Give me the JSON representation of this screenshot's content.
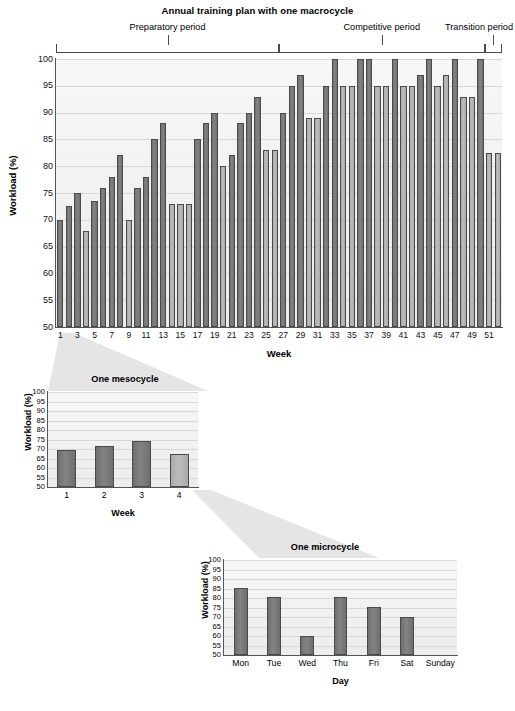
{
  "main": {
    "title": "Annual training plan with one macrocycle",
    "ylabel": "Workload (%)",
    "xlabel": "Week",
    "periods": [
      {
        "label": "Preparatory period"
      },
      {
        "label": "Competitive period"
      },
      {
        "label": "Transition period"
      }
    ]
  },
  "meso": {
    "title": "One mesocycle",
    "ylabel": "Workload (%)",
    "xlabel": "Week"
  },
  "micro": {
    "title": "One microcycle",
    "ylabel": "Workload (%)",
    "xlabel": "Day"
  },
  "chart_data": [
    {
      "type": "bar",
      "title": "Annual training plan with one macrocycle",
      "xlabel": "Week",
      "ylabel": "Workload (%)",
      "ylim": [
        50,
        100
      ],
      "yticks": [
        50,
        55,
        60,
        65,
        70,
        75,
        80,
        85,
        90,
        95,
        100
      ],
      "grid": true,
      "legend": "none",
      "categories": [
        1,
        2,
        3,
        4,
        5,
        6,
        7,
        8,
        9,
        10,
        11,
        12,
        13,
        14,
        15,
        16,
        17,
        18,
        19,
        20,
        21,
        22,
        23,
        24,
        25,
        26,
        27,
        28,
        29,
        30,
        31,
        32,
        33,
        34,
        35,
        36,
        37,
        38,
        39,
        40,
        41,
        42,
        43,
        44,
        45,
        46,
        47,
        48,
        49,
        50,
        51,
        52
      ],
      "xtick_labels": [
        1,
        3,
        5,
        7,
        9,
        11,
        13,
        15,
        17,
        19,
        21,
        23,
        25,
        27,
        29,
        31,
        33,
        35,
        37,
        39,
        41,
        43,
        45,
        47,
        49,
        51
      ],
      "values": [
        70,
        72.5,
        75,
        68,
        73.5,
        76,
        78,
        82,
        70,
        76,
        78,
        85,
        88,
        73,
        73,
        73,
        85,
        88,
        90,
        80,
        82,
        88,
        90,
        93,
        83,
        83,
        90,
        95,
        97,
        89,
        89,
        95,
        100,
        95,
        95,
        100,
        100,
        95,
        95,
        100,
        95,
        95,
        97,
        100,
        95,
        97,
        100,
        93,
        93,
        100,
        82.5,
        82.5
      ],
      "bar_shades": [
        "dark",
        "dark",
        "dark",
        "light",
        "dark",
        "dark",
        "dark",
        "dark",
        "light",
        "dark",
        "dark",
        "dark",
        "dark",
        "light",
        "light",
        "light",
        "dark",
        "dark",
        "dark",
        "light",
        "dark",
        "dark",
        "dark",
        "dark",
        "light",
        "light",
        "dark",
        "dark",
        "dark",
        "light",
        "light",
        "dark",
        "dark",
        "light",
        "light",
        "dark",
        "dark",
        "light",
        "light",
        "dark",
        "light",
        "light",
        "dark",
        "dark",
        "light",
        "light",
        "dark",
        "light",
        "light",
        "dark",
        "light",
        "light"
      ],
      "annotations": [
        {
          "text": "Preparatory period",
          "span_weeks": [
            1,
            26
          ]
        },
        {
          "text": "Competitive period",
          "span_weeks": [
            27,
            50
          ]
        },
        {
          "text": "Transition period",
          "span_weeks": [
            51,
            52
          ]
        }
      ],
      "colors": {
        "dark_bar": "#6f6f6f",
        "light_bar": "#a9a9a9",
        "bar_border": "#4a4a4a",
        "grid": "#d8d8d8"
      }
    },
    {
      "type": "bar",
      "title": "One mesocycle",
      "xlabel": "Week",
      "ylabel": "Workload (%)",
      "ylim": [
        50,
        100
      ],
      "yticks": [
        50,
        55,
        60,
        65,
        70,
        75,
        80,
        85,
        90,
        95,
        100
      ],
      "grid": true,
      "categories": [
        "1",
        "2",
        "3",
        "4"
      ],
      "values": [
        69.5,
        71.5,
        74,
        67.5
      ],
      "bar_shades": [
        "dark",
        "dark",
        "dark",
        "light"
      ]
    },
    {
      "type": "bar",
      "title": "One microcycle",
      "xlabel": "Day",
      "ylabel": "Workload (%)",
      "ylim": [
        50,
        100
      ],
      "yticks": [
        50,
        55,
        60,
        65,
        70,
        75,
        80,
        85,
        90,
        95,
        100
      ],
      "grid": true,
      "categories": [
        "Mon",
        "Tue",
        "Wed",
        "Thu",
        "Fri",
        "Sat",
        "Sunday"
      ],
      "values": [
        85.5,
        80.5,
        60,
        80.5,
        75.5,
        70,
        50
      ],
      "bar_shades": [
        "dark",
        "dark",
        "dark",
        "dark",
        "dark",
        "dark",
        "none"
      ]
    }
  ]
}
